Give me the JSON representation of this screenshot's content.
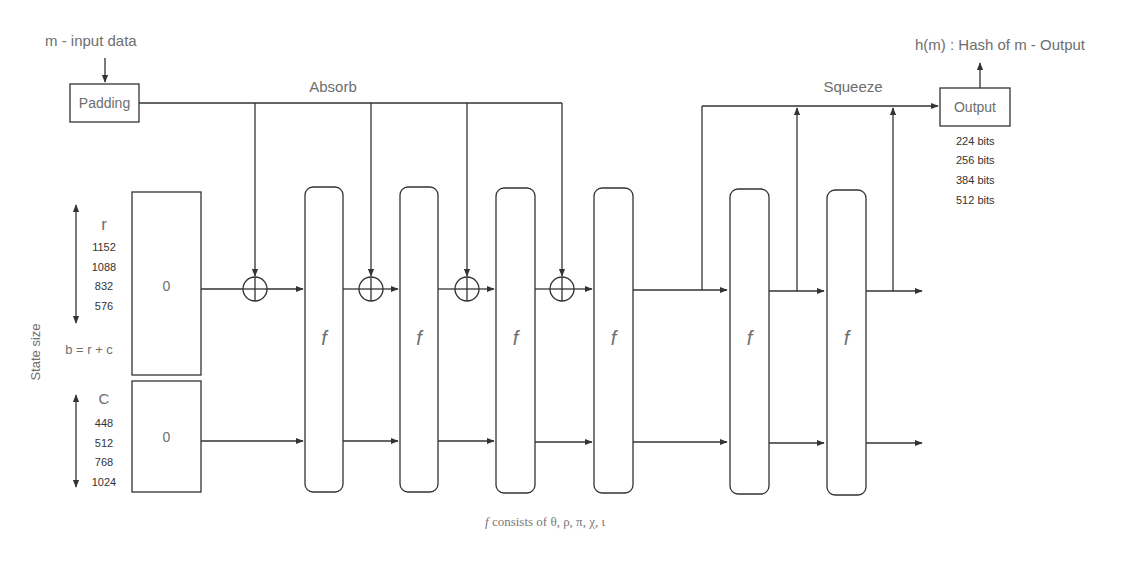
{
  "input": {
    "label": "m - input data",
    "padding_label": "Padding"
  },
  "phases": {
    "absorb": "Absorb",
    "squeeze": "Squeeze"
  },
  "state": {
    "axis_label": "State size",
    "formula": "b = r + c",
    "rate": {
      "symbol": "r",
      "values": [
        "1152",
        "1088",
        "832",
        "576"
      ],
      "initial": "0"
    },
    "capacity": {
      "symbol": "C",
      "values": [
        "448",
        "512",
        "768",
        "1024"
      ],
      "initial": "0"
    }
  },
  "functions": {
    "label": "f",
    "absorb_count": 4,
    "squeeze_count": 2,
    "items": [
      "f",
      "f",
      "f",
      "f",
      "f",
      "f"
    ]
  },
  "xor_symbol": "⊕",
  "output": {
    "label": "h(m) : Hash of m - Output",
    "box_label": "Output",
    "sizes": [
      "224 bits",
      "256 bits",
      "384 bits",
      "512 bits"
    ]
  },
  "footnote": {
    "prefix": "f",
    "text": " consists of θ, ρ, π, χ, ι"
  }
}
